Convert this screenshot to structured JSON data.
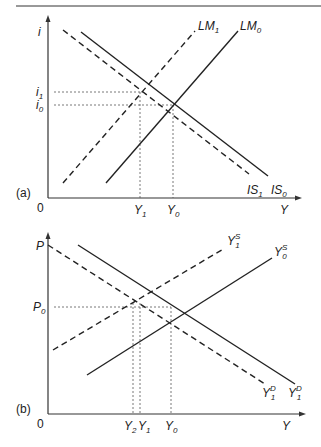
{
  "panel_a": {
    "tag": "(a)",
    "y_axis_label": "i",
    "x_axis_label": "Y",
    "origin_label": "0",
    "tick_labels_y": [
      {
        "base": "i",
        "sub": "1"
      },
      {
        "base": "i",
        "sub": "0"
      }
    ],
    "tick_labels_x": [
      {
        "base": "Y",
        "sub": "1"
      },
      {
        "base": "Y",
        "sub": "0"
      }
    ],
    "curves": [
      {
        "name": "LM1",
        "base": "LM",
        "sub": "1",
        "style": "dashed"
      },
      {
        "name": "LM0",
        "base": "LM",
        "sub": "0",
        "style": "solid"
      },
      {
        "name": "IS1",
        "base": "IS",
        "sub": "1",
        "style": "dashed"
      },
      {
        "name": "IS0",
        "base": "IS",
        "sub": "0",
        "style": "solid"
      }
    ]
  },
  "panel_b": {
    "tag": "(b)",
    "y_axis_label": "P",
    "x_axis_label": "Y",
    "origin_label": "0",
    "tick_labels_y": [
      {
        "base": "P",
        "sub": "0"
      }
    ],
    "tick_labels_x": [
      {
        "base": "Y",
        "sub": "2"
      },
      {
        "base": "Y",
        "sub": "1"
      },
      {
        "base": "Y",
        "sub": "0"
      }
    ],
    "curves": [
      {
        "name": "Y1S",
        "base": "Y",
        "sup": "S",
        "sub": "1",
        "style": "dashed"
      },
      {
        "name": "Y0S",
        "base": "Y",
        "sup": "S",
        "sub": "0",
        "style": "solid"
      },
      {
        "name": "Y1D-dashed",
        "base": "Y",
        "sup": "D",
        "sub": "1",
        "style": "dashed"
      },
      {
        "name": "Y1D-solid",
        "base": "Y",
        "sup": "D",
        "sub": "1",
        "style": "solid"
      }
    ]
  }
}
